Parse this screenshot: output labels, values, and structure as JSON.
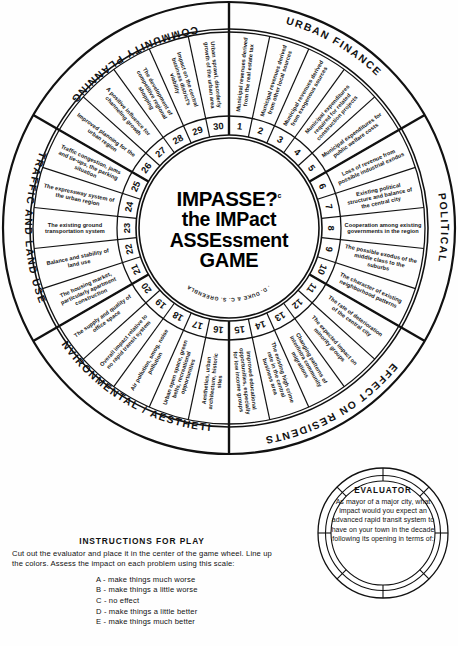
{
  "title": {
    "line1": "IMPASSE?",
    "superscript": "c",
    "line2": "the IMPact",
    "line3": "ASSEssment",
    "line4": "GAME",
    "authors": "R. D. DUKE  &  C. S. GREENBLAT"
  },
  "sectors": [
    {
      "name": "URBAN FINANCE",
      "start_deg": 0,
      "end_deg": 60
    },
    {
      "name": "POLITICAL",
      "start_deg": 60,
      "end_deg": 120
    },
    {
      "name": "EFFECT ON RESIDENTS",
      "start_deg": 120,
      "end_deg": 180
    },
    {
      "name": "ENVIRONMENTAL / AESTHETIC",
      "start_deg": 180,
      "end_deg": 240
    },
    {
      "name": "TRAFFIC AND LAND USE",
      "start_deg": 240,
      "end_deg": 300
    },
    {
      "name": "COMMUNITY PLANNING",
      "start_deg": 300,
      "end_deg": 360
    }
  ],
  "segments": [
    {
      "n": "1",
      "label": "Municipal revenues derived from the real estate tax"
    },
    {
      "n": "2",
      "label": "Municipal revenues derived from other local sources"
    },
    {
      "n": "3",
      "label": "Municipal revenues derived from exogenous sources"
    },
    {
      "n": "4",
      "label": "Municipal expenditures required for related construction projects"
    },
    {
      "n": "5",
      "label": "Municipal expenditures for public welfare costs"
    },
    {
      "n": "6",
      "label": "Loss of revenue from possible industrial exodus"
    },
    {
      "n": "7",
      "label": "Existing political structure and balance of the central city"
    },
    {
      "n": "8",
      "label": "Cooperation among existing governments in the region"
    },
    {
      "n": "9",
      "label": "The possible exodus of the middle class to the suburbs"
    },
    {
      "n": "10",
      "label": "The character of existing neighborhood patterns"
    },
    {
      "n": "11",
      "label": "The rate of deterioration of the central city"
    },
    {
      "n": "12",
      "label": "The expected impact on minority groups"
    },
    {
      "n": "13",
      "label": "Changing patterns of inter/intra community migrations"
    },
    {
      "n": "14",
      "label": "The existing high crime rate in the central business area"
    },
    {
      "n": "15",
      "label": "Improved educational opportunities, especially for low income groups"
    },
    {
      "n": "16",
      "label": "Aesthetics, urban architecture, historic sites"
    },
    {
      "n": "17",
      "label": "Urban open space, green belts, recreational opportunities"
    },
    {
      "n": "18",
      "label": "Air pollution, smog, noise pollution"
    },
    {
      "n": "19",
      "label": "Overall impact relative to no rapid transit system"
    },
    {
      "n": "20",
      "label": "The supply and quality of office space"
    },
    {
      "n": "21",
      "label": "The housing market, particularly apartment construction"
    },
    {
      "n": "22",
      "label": "Balance and stability of land use"
    },
    {
      "n": "23",
      "label": "The existing ground transportation system"
    },
    {
      "n": "24",
      "label": "The expressway system of the urban region"
    },
    {
      "n": "25",
      "label": "Traffic congestion, jams and tie-ups, the parking situation"
    },
    {
      "n": "26",
      "label": "Improved planning for the urban region"
    },
    {
      "n": "27",
      "label": "A positive influence for channeling growth"
    },
    {
      "n": "28",
      "label": "The development of competitive regional shopping"
    },
    {
      "n": "29",
      "label": "Impact on the central business district's viability"
    },
    {
      "n": "30",
      "label": "Urban sprawl, disorderly growth of the urban area"
    }
  ],
  "instructions": {
    "heading": "INSTRUCTIONS FOR PLAY",
    "body": "Cut out the evaluator and place it in the center of the game wheel. Line up the colors. Assess the impact on each problem using this scale:",
    "scale": [
      {
        "key": "A",
        "text": "make things much worse"
      },
      {
        "key": "B",
        "text": "make things a little worse"
      },
      {
        "key": "C",
        "text": "no effect"
      },
      {
        "key": "D",
        "text": "make things a little better"
      },
      {
        "key": "E",
        "text": "make things much better"
      }
    ]
  },
  "evaluator": {
    "heading": "EVALUATOR",
    "body": "As mayor of a major city, what impact would you expect an advanced rapid transit system to have on your town in the decade following its opening in terms of:"
  },
  "colors": {
    "ink": "#111111",
    "paper": "#fefefe"
  }
}
